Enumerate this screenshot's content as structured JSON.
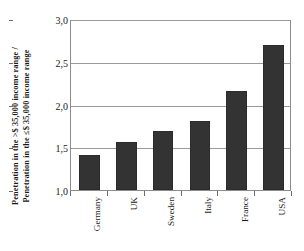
{
  "chart_data": {
    "type": "bar",
    "title": "",
    "subtitle": "",
    "xlabel": "",
    "ylabel_line1": "Penetration in the >$ 35,000 income range /",
    "ylabel_line2": "Penetration in the ≤$ 35,000 income range",
    "categories": [
      "Germany",
      "UK",
      "Sweden",
      "Italy",
      "France",
      "USA"
    ],
    "values": [
      1.41,
      1.56,
      1.69,
      1.81,
      2.16,
      2.7
    ],
    "ylim": [
      1.0,
      3.0
    ],
    "yticks": [
      1.0,
      1.5,
      2.0,
      2.5,
      3.0
    ],
    "ytick_labels": [
      "1,0",
      "1,5",
      "2,0",
      "2,5",
      "3,0"
    ],
    "decimal_separator": ",",
    "grid": true,
    "grid_axis": "y",
    "legend": false,
    "legend_position": "none",
    "bar_color": "#333333",
    "bar_edge_color": "#2b2b2b",
    "grid_color": "#9a9a9a",
    "axis_color": "#8c8c8c",
    "text_color": "#1a1a1a",
    "background": "#ffffff",
    "series": [
      {
        "name": "Penetration ratio",
        "values": [
          1.41,
          1.56,
          1.69,
          1.81,
          2.16,
          2.7
        ]
      }
    ]
  }
}
